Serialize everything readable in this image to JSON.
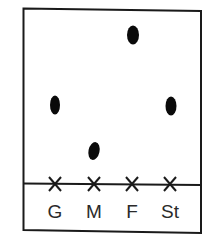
{
  "diagram": {
    "type": "paper-chromatogram",
    "plate": {
      "border_color": "#1a1a1a",
      "background": "#ffffff"
    },
    "baseline": {
      "color": "#1a1a1a"
    },
    "lanes": [
      {
        "label": "G",
        "marker": "x",
        "spot_color": "#0a0a0a"
      },
      {
        "label": "M",
        "marker": "x",
        "spot_color": "#0a0a0a"
      },
      {
        "label": "F",
        "marker": "x",
        "spot_color": "#0a0a0a"
      },
      {
        "label": "St",
        "marker": "x",
        "spot_color": "#0a0a0a"
      }
    ]
  }
}
